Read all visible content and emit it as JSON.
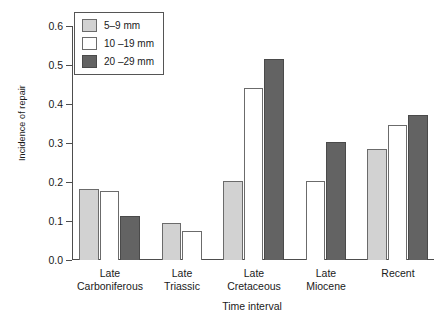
{
  "chart_data": {
    "type": "bar",
    "title": "",
    "xlabel": "Time interval",
    "ylabel": "Incidence of repair",
    "ylim": [
      0.0,
      0.6
    ],
    "yticks": [
      "0.0",
      "0.1",
      "0.2",
      "0.3",
      "0.4",
      "0.5",
      "0.6"
    ],
    "ytick_values": [
      0.0,
      0.1,
      0.2,
      0.3,
      0.4,
      0.5,
      0.6
    ],
    "grid": false,
    "legend_position": "top-left",
    "categories": [
      "Late Carboniferous",
      "Late Triassic",
      "Late Cretaceous",
      "Late Miocene",
      "Recent"
    ],
    "category_lines": [
      [
        "Late",
        "Carboniferous"
      ],
      [
        "Late",
        "Triassic"
      ],
      [
        "Late",
        "Cretaceous"
      ],
      [
        "Late",
        "Miocene"
      ],
      [
        "Recent",
        ""
      ]
    ],
    "series": [
      {
        "name": "5–9 mm",
        "color": "#d2d2d2",
        "values": [
          0.182,
          0.094,
          0.202,
          null,
          0.285
        ]
      },
      {
        "name": "10 –19 mm",
        "color": "#ffffff",
        "values": [
          0.178,
          0.075,
          0.442,
          0.202,
          0.345
        ]
      },
      {
        "name": "20 –29 mm",
        "color": "#636363",
        "values": [
          0.113,
          null,
          0.516,
          0.302,
          0.372
        ]
      }
    ]
  },
  "legend": {
    "items": [
      {
        "label": "5–9 mm",
        "swatch": "s1"
      },
      {
        "label": "10 –19 mm",
        "swatch": "s2"
      },
      {
        "label": "20 –29 mm",
        "swatch": "s3"
      }
    ]
  }
}
